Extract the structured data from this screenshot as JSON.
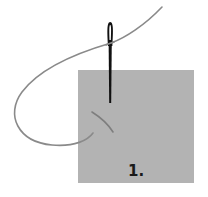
{
  "diagram": {
    "step_label": "1.",
    "colors": {
      "fabric": "#b3b3b3",
      "needle": "#111111",
      "thread": "#8a8a8a",
      "label": "#1a1a1a",
      "background": "#ffffff"
    }
  }
}
